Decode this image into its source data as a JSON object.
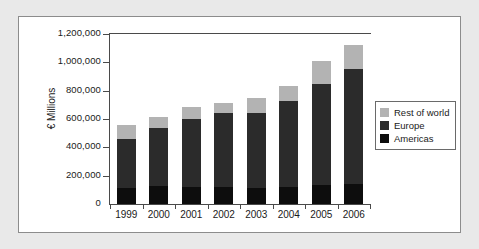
{
  "chart_data": {
    "type": "bar",
    "stacked": true,
    "title": "",
    "subtitle": "",
    "xlabel": "",
    "ylabel": "€ Millions",
    "categories": [
      "1999",
      "2000",
      "2001",
      "2002",
      "2003",
      "2004",
      "2005",
      "2006"
    ],
    "series": [
      {
        "name": "Americas",
        "color": "#0d0d0d",
        "values": [
          115000,
          125000,
          120000,
          118000,
          112000,
          122000,
          135000,
          138000
        ]
      },
      {
        "name": "Europe",
        "color": "#2b2b2b",
        "values": [
          347000,
          415000,
          477000,
          522000,
          534000,
          602000,
          710000,
          812000
        ]
      },
      {
        "name": "Rest of world",
        "color": "#b3b3b3",
        "values": [
          93000,
          72000,
          88000,
          70000,
          99000,
          106000,
          162000,
          170000
        ]
      }
    ],
    "totals": [
      555000,
      612000,
      685000,
      710000,
      745000,
      830000,
      1007000,
      1120000
    ],
    "ylim": [
      0,
      1200000
    ],
    "ytick_labels": [
      "0",
      "200,000",
      "400,000",
      "600,000",
      "800,000",
      "1,000,000",
      "1,200,000"
    ],
    "ytick_values": [
      0,
      200000,
      400000,
      600000,
      800000,
      1000000,
      1200000
    ],
    "grid": false,
    "legend_position": "right"
  },
  "legend": {
    "items": [
      {
        "label": "Rest of world",
        "color": "#b3b3b3"
      },
      {
        "label": "Europe",
        "color": "#2b2b2b"
      },
      {
        "label": "Americas",
        "color": "#0d0d0d"
      }
    ]
  },
  "colors": {
    "page_background": "#e9e9e9",
    "panel_background": "#ffffff",
    "panel_border": "#8c8c8c",
    "axis": "#4a4a4a",
    "text": "#1a1a1a"
  }
}
